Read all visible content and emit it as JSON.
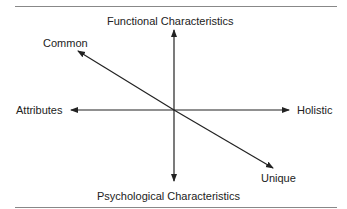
{
  "diagram": {
    "labels": {
      "top": "Functional Characteristics",
      "bottom": "Psychological Characteristics",
      "left": "Attributes",
      "right": "Holistic",
      "upper_left": "Common",
      "lower_right": "Unique"
    },
    "colors": {
      "axis": "#222222",
      "rule": "#888888"
    }
  }
}
